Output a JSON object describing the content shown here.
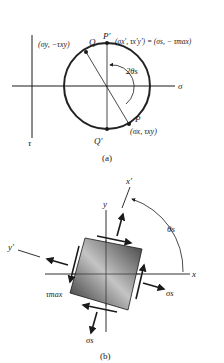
{
  "figure_a": {
    "caption": "(a)",
    "axis_sigma": "σ",
    "axis_tau": "τ",
    "point_Q": "Q",
    "point_Q_coords": "(σy, −τxy)",
    "point_P_prime": "P′",
    "point_P_prime_coords": "(σx′, τx′y′) = (σs, − τmax)",
    "point_P": "P",
    "point_P_coords": "(σx, τxy)",
    "point_Q_prime": "Q′",
    "angle_label": "2θs"
  },
  "figure_b": {
    "caption": "(b)",
    "axis_x": "x",
    "axis_y": "y",
    "axis_x_prime": "x′",
    "axis_y_prime": "y′",
    "angle_label": "θs",
    "shear_label": "τmax",
    "normal_stress_right": "σs",
    "normal_stress_bottom": "σs"
  },
  "colors": {
    "ink": "#1a1a1a",
    "circle": "#222222",
    "element_dark": "#3a3a3a",
    "element_light": "#bdbdbd"
  }
}
